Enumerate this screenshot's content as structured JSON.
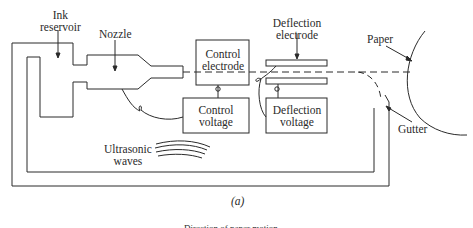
{
  "figure": {
    "caption": "(a)",
    "labels": {
      "ink_reservoir_line1": "Ink",
      "ink_reservoir_line2": "reservoir",
      "nozzle": "Nozzle",
      "control_electrode_line1": "Control",
      "control_electrode_line2": "electrode",
      "control_voltage_line1": "Control",
      "control_voltage_line2": "voltage",
      "deflection_electrode_line1": "Deflection",
      "deflection_electrode_line2": "electrode",
      "deflection_voltage_line1": "Deflection",
      "deflection_voltage_line2": "voltage",
      "ultrasonic_line1": "Ultrasonic",
      "ultrasonic_line2": "waves",
      "paper": "Paper",
      "gutter": "Gutter",
      "bottom_partial": "Direction of paper motion"
    },
    "colors": {
      "line": "#2a2a2a",
      "background": "#ffffff"
    }
  }
}
